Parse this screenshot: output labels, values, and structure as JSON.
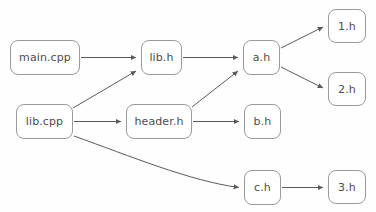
{
  "diagram": {
    "type": "directed-graph",
    "canvas": {
      "width": 376,
      "height": 212,
      "background": "#fefefe"
    },
    "style": {
      "node_border_color": "#9a9a9a",
      "node_fill_color": "#ffffff",
      "node_text_color": "#4d4d4d",
      "edge_color": "#5a5a5a",
      "node_corner_radius": 8,
      "font_size_px": 11
    },
    "partial_text_top": "",
    "nodes": [
      {
        "id": "main_cpp",
        "label": "main.cpp",
        "x": 10,
        "y": 40,
        "w": 70,
        "h": 35
      },
      {
        "id": "lib_cpp",
        "label": "lib.cpp",
        "x": 16,
        "y": 104,
        "w": 57,
        "h": 35
      },
      {
        "id": "lib_h",
        "label": "lib.h",
        "x": 141,
        "y": 40,
        "w": 41,
        "h": 35
      },
      {
        "id": "header_h",
        "label": "header.h",
        "x": 126,
        "y": 104,
        "w": 66,
        "h": 35
      },
      {
        "id": "a_h",
        "label": "a.h",
        "x": 243,
        "y": 40,
        "w": 37,
        "h": 35
      },
      {
        "id": "b_h",
        "label": "b.h",
        "x": 244,
        "y": 104,
        "w": 37,
        "h": 35
      },
      {
        "id": "c_h",
        "label": "c.h",
        "x": 244,
        "y": 170,
        "w": 37,
        "h": 35
      },
      {
        "id": "one_h",
        "label": "1.h",
        "x": 328,
        "y": 9,
        "w": 38,
        "h": 34
      },
      {
        "id": "two_h",
        "label": "2.h",
        "x": 328,
        "y": 72,
        "w": 38,
        "h": 34
      },
      {
        "id": "three_h",
        "label": "3.h",
        "x": 328,
        "y": 170,
        "w": 38,
        "h": 34
      }
    ],
    "edges": [
      {
        "id": "e1",
        "from": "main_cpp",
        "to": "lib_h",
        "shape": "straight",
        "path": "M 81 57.5 L 136 57.5"
      },
      {
        "id": "e2",
        "from": "lib_cpp",
        "to": "lib_h",
        "shape": "straight",
        "path": "M 73 108 L 136 71"
      },
      {
        "id": "e3",
        "from": "lib_cpp",
        "to": "header_h",
        "shape": "straight",
        "path": "M 74 121.5 L 121 121.5"
      },
      {
        "id": "e4",
        "from": "lib_cpp",
        "to": "c_h",
        "shape": "curve",
        "path": "M 74 136 C 130 156 190 181 239 187.5"
      },
      {
        "id": "e5",
        "from": "lib_h",
        "to": "a_h",
        "shape": "straight",
        "path": "M 183 57.5 L 238 57.5"
      },
      {
        "id": "e6",
        "from": "header_h",
        "to": "a_h",
        "shape": "straight",
        "path": "M 192 107 L 238 71"
      },
      {
        "id": "e7",
        "from": "header_h",
        "to": "b_h",
        "shape": "straight",
        "path": "M 193 121.5 L 239 121.5"
      },
      {
        "id": "e8",
        "from": "a_h",
        "to": "one_h",
        "shape": "straight",
        "path": "M 281 48 L 323 27"
      },
      {
        "id": "e9",
        "from": "a_h",
        "to": "two_h",
        "shape": "straight",
        "path": "M 281 67 L 323 88"
      },
      {
        "id": "e10",
        "from": "c_h",
        "to": "three_h",
        "shape": "straight",
        "path": "M 282 187.5 L 323 187.5"
      }
    ]
  }
}
